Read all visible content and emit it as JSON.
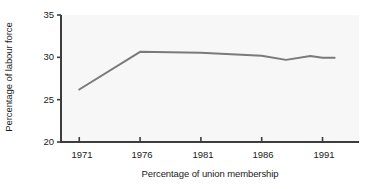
{
  "chart_data": {
    "type": "line",
    "title": "",
    "xlabel": "Percentage of union membership",
    "ylabel": "Percentage of labour force",
    "xlim": [
      1969.5,
      1994
    ],
    "ylim": [
      20,
      35
    ],
    "xticks": [
      1971,
      1976,
      1981,
      1986,
      1991
    ],
    "xtick_labels": [
      "1971",
      "1976",
      "1981",
      "1986",
      "1991"
    ],
    "yticks": [
      20,
      25,
      30,
      35
    ],
    "ytick_labels": [
      "20",
      "25",
      "30",
      "35"
    ],
    "grid": false,
    "legend": null,
    "series": [
      {
        "name": "Percentage of labour force",
        "color": "#7a7a7a",
        "x": [
          1971,
          1976,
          1981,
          1986,
          1988,
          1990,
          1991,
          1992
        ],
        "values": [
          26.2,
          30.65,
          30.55,
          30.2,
          29.7,
          30.15,
          29.95,
          29.95
        ]
      }
    ],
    "plot_background": "#f7f7f7",
    "axis_color": "#3d3d3d",
    "line_color": "#7a7a7a"
  },
  "axes": {
    "ytick_0": "20",
    "ytick_1": "25",
    "ytick_2": "30",
    "ytick_3": "35",
    "xtick_0": "1971",
    "xtick_1": "1976",
    "xtick_2": "1981",
    "xtick_3": "1986",
    "xtick_4": "1991"
  }
}
